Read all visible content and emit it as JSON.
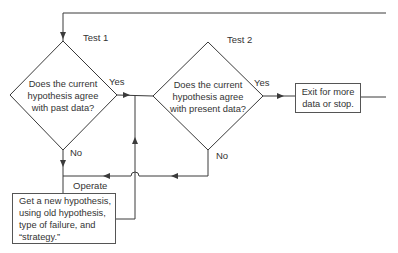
{
  "diagram": {
    "test1": {
      "label": "Test 1",
      "question_lines": [
        "Does the current",
        "hypothesis agree",
        "with past data?"
      ],
      "yes_label": "Yes",
      "no_label": "No"
    },
    "test2": {
      "label": "Test 2",
      "question_lines": [
        "Does the current",
        "hypothesis agree",
        "with present data?"
      ],
      "yes_label": "Yes",
      "no_label": "No"
    },
    "exit_box": {
      "lines": [
        "Exit for more",
        "data or stop."
      ]
    },
    "operate_label": "Operate",
    "new_hypothesis_box": {
      "lines": [
        "Get a new hypothesis,",
        "using old hypothesis,",
        "type of failure, and",
        "“strategy.”"
      ]
    },
    "colors": {
      "line": "#3a3a3a",
      "background": "#ffffff",
      "text": "#333333"
    }
  }
}
